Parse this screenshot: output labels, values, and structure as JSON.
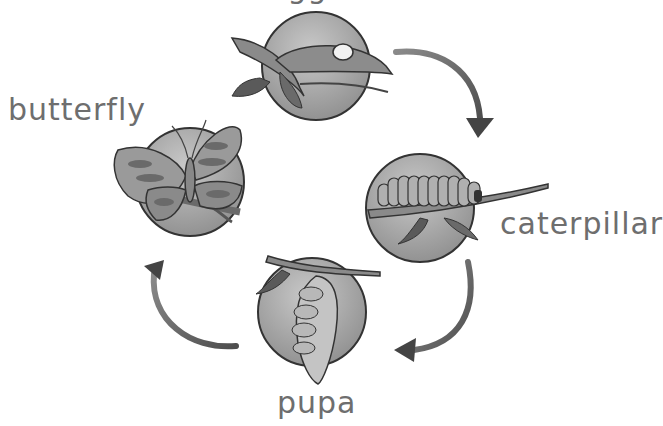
{
  "diagram": {
    "stages": [
      {
        "id": "egg",
        "label": "egg",
        "icon": "egg-on-leaf-icon"
      },
      {
        "id": "caterpillar",
        "label": "caterpillar",
        "icon": "caterpillar-on-branch-icon"
      },
      {
        "id": "pupa",
        "label": "pupa",
        "icon": "chrysalis-hanging-icon"
      },
      {
        "id": "butterfly",
        "label": "butterfly",
        "icon": "butterfly-on-branch-icon"
      }
    ],
    "arrows": [
      {
        "from": "egg",
        "to": "caterpillar",
        "direction": "clockwise"
      },
      {
        "from": "caterpillar",
        "to": "pupa",
        "direction": "clockwise"
      },
      {
        "from": "pupa",
        "to": "butterfly",
        "direction": "clockwise"
      }
    ],
    "colors": {
      "background": "#ffffff",
      "circle_fill": "#a8a8a8",
      "circle_stroke": "#3a3a3a",
      "branch": "#7a7a7a",
      "leaf": "#5e5e5e",
      "label": "#6e6e6e",
      "arrow": "#6a6a6a"
    }
  }
}
